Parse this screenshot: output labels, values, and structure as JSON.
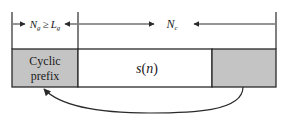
{
  "diagram": {
    "type": "ofdm-cyclic-prefix",
    "colors": {
      "line": "#2a2a2a",
      "shaded": "#c4c4c4",
      "background": "#ffffff"
    },
    "top_annotation": {
      "guard_label": {
        "N": "N",
        "N_sub": "g",
        "relation": "≥",
        "L": "L",
        "L_sub": "g"
      },
      "symbol_label": {
        "N": "N",
        "N_sub": "c"
      }
    },
    "blocks": [
      {
        "id": "cyclic-prefix",
        "line1": "Cyclic",
        "line2": "prefix",
        "shaded": true
      },
      {
        "id": "signal",
        "label_main": "s",
        "label_paren_open": "(",
        "label_arg": "n",
        "label_paren_close": ")",
        "shaded": false
      },
      {
        "id": "tail",
        "label": "",
        "shaded": true
      }
    ],
    "arrow": {
      "description": "copy tail of symbol to cyclic prefix"
    }
  }
}
